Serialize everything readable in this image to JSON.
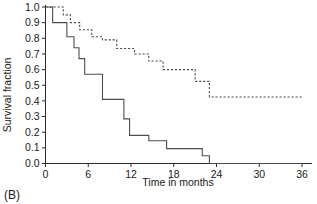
{
  "panel": {
    "label": "(B)"
  },
  "chart_data": {
    "type": "line",
    "subtype": "kaplan-meier-step",
    "title": "",
    "subtitle": "",
    "xlabel": "Time in months",
    "ylabel": "Survival fraction",
    "xlim": [
      0,
      36
    ],
    "ylim": [
      0.0,
      1.0
    ],
    "xticks": [
      0,
      6,
      12,
      18,
      24,
      30,
      36
    ],
    "xtick_labels": [
      "0",
      "6",
      "12",
      "18",
      "24",
      "30",
      "36"
    ],
    "yticks": [
      0.0,
      0.1,
      0.2,
      0.3,
      0.4,
      0.5,
      0.6,
      0.7,
      0.8,
      0.9,
      1.0
    ],
    "ytick_labels": [
      "0.0",
      "0.1",
      "0.2",
      "0.3",
      "0.4",
      "0.5",
      "0.6",
      "0.7",
      "0.8",
      "0.9",
      "1.0"
    ],
    "grid": false,
    "legend": null,
    "legend_position": "none",
    "colors": {
      "axis": "#2b2b2b",
      "series_solid": "#4d4d4d",
      "series_dashed": "#4d4d4d",
      "background": "#ffffff"
    },
    "series": [
      {
        "name": "solid-curve",
        "style": "solid",
        "x": [
          0.0,
          1.0,
          1.0,
          3.0,
          3.0,
          4.0,
          4.0,
          4.7,
          4.7,
          5.5,
          5.5,
          8.0,
          8.0,
          11.0,
          11.0,
          11.8,
          11.8,
          14.5,
          14.5,
          17.0,
          17.0,
          22.0,
          22.0,
          23.0,
          23.0,
          36.0
        ],
        "y": [
          1.0,
          1.0,
          0.9,
          0.9,
          0.81,
          0.81,
          0.74,
          0.74,
          0.67,
          0.67,
          0.57,
          0.57,
          0.41,
          0.41,
          0.285,
          0.285,
          0.18,
          0.18,
          0.145,
          0.145,
          0.095,
          0.095,
          0.05,
          0.05,
          0.0,
          0.0
        ],
        "steps": [
          {
            "time": 0.0,
            "survival": 1.0
          },
          {
            "time": 1.0,
            "survival": 0.9
          },
          {
            "time": 3.0,
            "survival": 0.81
          },
          {
            "time": 4.0,
            "survival": 0.74
          },
          {
            "time": 4.7,
            "survival": 0.67
          },
          {
            "time": 5.5,
            "survival": 0.57
          },
          {
            "time": 8.0,
            "survival": 0.41
          },
          {
            "time": 11.0,
            "survival": 0.285
          },
          {
            "time": 11.8,
            "survival": 0.18
          },
          {
            "time": 14.5,
            "survival": 0.145
          },
          {
            "time": 17.0,
            "survival": 0.095
          },
          {
            "time": 22.0,
            "survival": 0.05
          },
          {
            "time": 23.0,
            "survival": 0.0
          },
          {
            "time": 36.0,
            "survival": 0.0
          }
        ]
      },
      {
        "name": "dashed-curve",
        "style": "dashed",
        "x": [
          0.0,
          2.5,
          2.5,
          3.5,
          3.5,
          4.8,
          4.8,
          6.5,
          6.5,
          8.0,
          8.0,
          10.0,
          10.0,
          12.5,
          12.5,
          14.5,
          14.5,
          16.5,
          16.5,
          21.0,
          21.0,
          23.0,
          23.0,
          36.0
        ],
        "y": [
          1.0,
          1.0,
          0.95,
          0.95,
          0.9,
          0.9,
          0.855,
          0.855,
          0.81,
          0.81,
          0.79,
          0.79,
          0.735,
          0.735,
          0.7,
          0.7,
          0.655,
          0.655,
          0.6,
          0.6,
          0.525,
          0.525,
          0.425,
          0.425
        ],
        "steps": [
          {
            "time": 0.0,
            "survival": 1.0
          },
          {
            "time": 2.5,
            "survival": 0.95
          },
          {
            "time": 3.5,
            "survival": 0.9
          },
          {
            "time": 4.8,
            "survival": 0.855
          },
          {
            "time": 6.5,
            "survival": 0.81
          },
          {
            "time": 8.0,
            "survival": 0.79
          },
          {
            "time": 10.0,
            "survival": 0.735
          },
          {
            "time": 12.5,
            "survival": 0.7
          },
          {
            "time": 14.5,
            "survival": 0.655
          },
          {
            "time": 16.5,
            "survival": 0.6
          },
          {
            "time": 21.0,
            "survival": 0.525
          },
          {
            "time": 23.0,
            "survival": 0.425
          },
          {
            "time": 36.0,
            "survival": 0.425
          }
        ]
      }
    ]
  }
}
